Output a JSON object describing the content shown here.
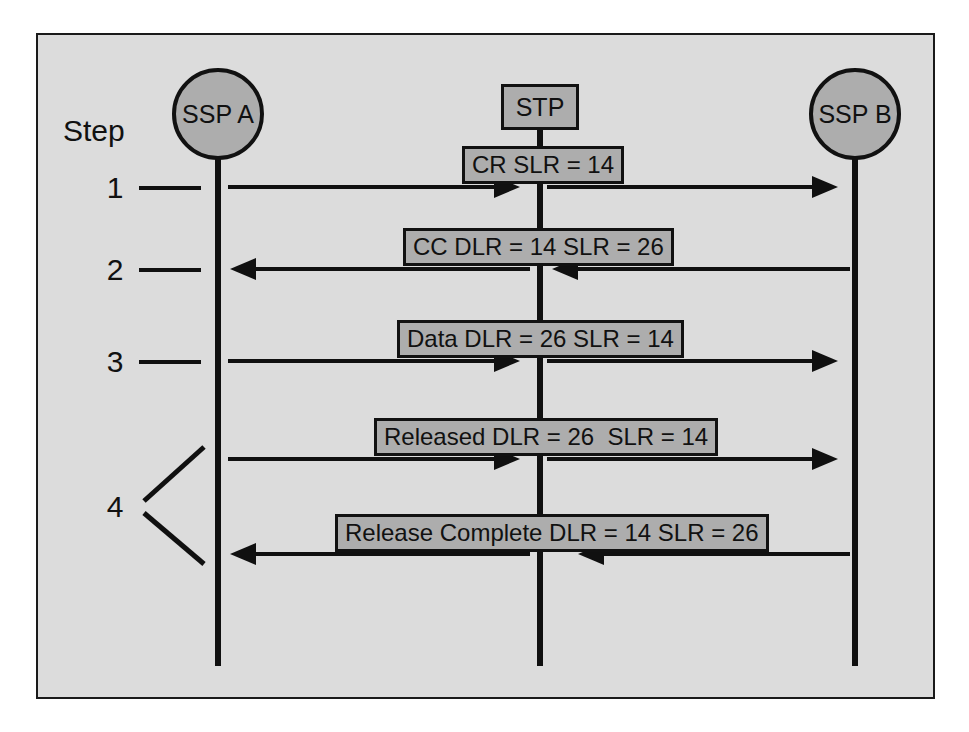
{
  "diagram": {
    "frame": {
      "background": "#dcdcdc",
      "border_color": "#1a1a1a"
    },
    "node_fill": "#adadad",
    "line_color": "#101010",
    "step_column_label": "Step",
    "nodes": [
      {
        "id": "ssp-a",
        "label": "SSP A",
        "shape": "circle"
      },
      {
        "id": "stp",
        "label": "STP",
        "shape": "rectangle"
      },
      {
        "id": "ssp-b",
        "label": "SSP B",
        "shape": "circle"
      }
    ],
    "steps": [
      {
        "number": "1"
      },
      {
        "number": "2"
      },
      {
        "number": "3"
      },
      {
        "number": "4"
      }
    ],
    "messages": [
      {
        "step": "1",
        "label": "CR SLR = 14",
        "direction": "right",
        "from": "SSP A",
        "to": "SSP B"
      },
      {
        "step": "2",
        "label": "CC DLR = 14 SLR = 26",
        "direction": "left",
        "from": "SSP B",
        "to": "SSP A"
      },
      {
        "step": "3",
        "label": "Data DLR = 26 SLR = 14",
        "direction": "right",
        "from": "SSP A",
        "to": "SSP B"
      },
      {
        "step": "4",
        "label": "Released DLR = 26  SLR = 14",
        "direction": "right",
        "from": "SSP A",
        "to": "SSP B"
      },
      {
        "step": "4",
        "label": "Release Complete DLR = 14 SLR = 26",
        "direction": "left",
        "from": "SSP B",
        "to": "SSP A"
      }
    ]
  }
}
